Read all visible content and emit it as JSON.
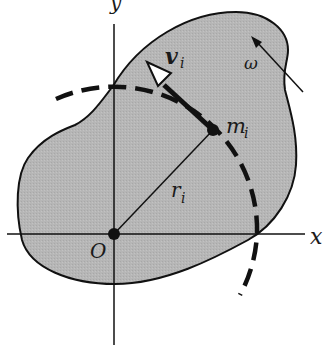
{
  "diagram": {
    "colors": {
      "body_fill": "#b4b4b4",
      "stroke": "#111111",
      "background": "#ffffff"
    },
    "axes": {
      "x_label": "x",
      "y_label": "y",
      "origin_label": "O"
    },
    "labels": {
      "velocity": "v",
      "velocity_subscript": "i",
      "mass": "m",
      "mass_subscript": "i",
      "radius": "r",
      "radius_subscript": "i",
      "angular_velocity": "ω"
    }
  }
}
